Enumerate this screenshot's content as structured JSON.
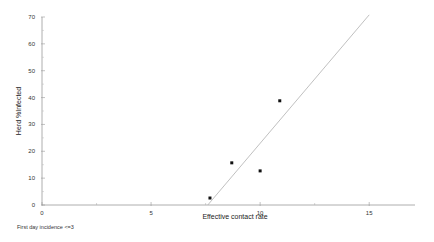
{
  "chart_data": {
    "type": "scatter",
    "title": "",
    "xlabel": "Effective contact rate",
    "ylabel": "Herd %Infected",
    "xlim": [
      0,
      17.1
    ],
    "ylim": [
      0,
      70
    ],
    "x_ticks": [
      0,
      5,
      10,
      15
    ],
    "x_minor_ticks": [
      2.5,
      7.5,
      12.5
    ],
    "y_ticks": [
      0,
      10,
      20,
      30,
      40,
      50,
      60,
      70
    ],
    "x_tick_labels": [
      "0",
      "5",
      "10",
      "15"
    ],
    "y_tick_labels": [
      "0",
      "10",
      "20",
      "30",
      "40",
      "50",
      "60",
      "70"
    ],
    "grid": false,
    "legend": null,
    "series": [
      {
        "name": "observed",
        "kind": "points",
        "color": "#111111",
        "points": [
          {
            "x": 7.7,
            "y": 2.6
          },
          {
            "x": 8.7,
            "y": 15.7
          },
          {
            "x": 10.0,
            "y": 12.7
          },
          {
            "x": 10.9,
            "y": 38.8
          }
        ]
      },
      {
        "name": "fitted line",
        "kind": "line",
        "color": "#b0b0b0",
        "points": [
          {
            "x": 7.6,
            "y": 0
          },
          {
            "x": 15.0,
            "y": 70.8
          }
        ]
      }
    ],
    "annotations": [
      "First day incidence <=3"
    ]
  },
  "footnote": "First day incidence <=3"
}
